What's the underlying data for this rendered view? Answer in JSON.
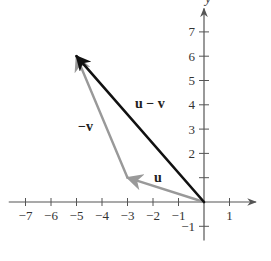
{
  "figure": {
    "type": "vector-diagram",
    "axes": {
      "x_label": "x",
      "y_label": "y",
      "x_ticks": [
        -7,
        -6,
        -5,
        -4,
        -3,
        -2,
        -1,
        1
      ],
      "x_tick_labels": [
        "−7",
        "−6",
        "−5",
        "−4",
        "−3",
        "−2",
        "−1",
        "1"
      ],
      "y_ticks": [
        -1,
        1,
        2,
        3,
        4,
        5,
        6,
        7
      ],
      "y_tick_labels": [
        "−1",
        "",
        "2",
        "3",
        "4",
        "5",
        "6",
        "7"
      ],
      "xlim": [
        -7.5,
        1.8
      ],
      "ylim": [
        -1.5,
        7.8
      ]
    },
    "vectors": [
      {
        "name": "u",
        "label": "u",
        "from": [
          0,
          0
        ],
        "to": [
          -3,
          1
        ],
        "color": "#999999"
      },
      {
        "name": "-v",
        "label": "−v",
        "from": [
          -3,
          1
        ],
        "to": [
          -5,
          6
        ],
        "color": "#999999"
      },
      {
        "name": "u-v",
        "label": "u − v",
        "from": [
          0,
          0
        ],
        "to": [
          -5,
          6
        ],
        "color": "#111111"
      }
    ]
  }
}
